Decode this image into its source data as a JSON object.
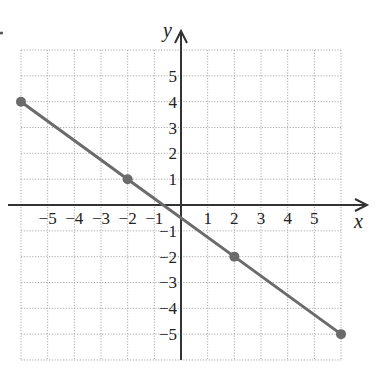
{
  "chart_data": {
    "type": "line",
    "title": "",
    "xlabel": "x",
    "ylabel": "y",
    "xlim": [
      -6,
      6
    ],
    "ylim": [
      -6,
      6
    ],
    "grid": true,
    "x_ticks": [
      -5,
      -4,
      -3,
      -2,
      -1,
      1,
      2,
      3,
      4,
      5
    ],
    "y_ticks": [
      -5,
      -4,
      -3,
      -2,
      -1,
      1,
      2,
      3,
      4,
      5
    ],
    "x_tick_labels": [
      "−5",
      "−4",
      "−3",
      "−2",
      "−1",
      "1",
      "2",
      "3",
      "4",
      "5"
    ],
    "y_tick_labels": [
      "−5",
      "−4",
      "−3",
      "−2",
      "−1",
      "1",
      "2",
      "3",
      "4",
      "5"
    ],
    "series": [
      {
        "name": "line",
        "equation": "y = -3/4 x - 1/2",
        "x": [
          -6,
          -2,
          2,
          6
        ],
        "y": [
          4,
          1,
          -2,
          -5
        ],
        "color": "#6b6b6b",
        "marked_points": [
          [
            -6,
            4
          ],
          [
            -2,
            1
          ],
          [
            2,
            -2
          ],
          [
            6,
            -5
          ]
        ]
      }
    ]
  },
  "labels": {
    "x_axis": "x",
    "y_axis": "y"
  }
}
